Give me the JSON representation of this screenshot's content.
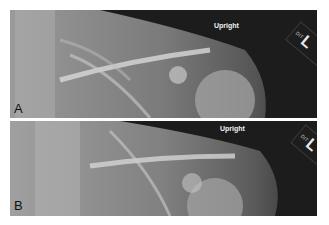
{
  "figure": {
    "panels": [
      {
        "id": "A",
        "letter": "A",
        "overlay_text": "Upright",
        "marker": "L",
        "marker_small": "DIT"
      },
      {
        "id": "B",
        "letter": "B",
        "overlay_text": "Upright",
        "marker": "L",
        "marker_small": "DIT"
      }
    ],
    "colors": {
      "background": "#ffffff",
      "label_text": "#111111",
      "overlay_text": "#f2f2f2"
    }
  }
}
